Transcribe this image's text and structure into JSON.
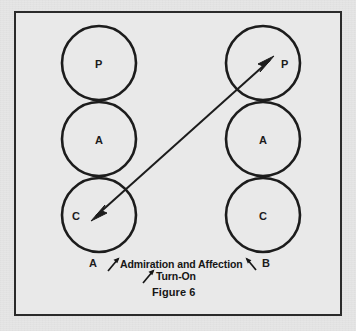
{
  "figure": {
    "number_label": "Figure 6",
    "frame": {
      "border_color": "#2b2b2b",
      "background": "#e9e9e9"
    },
    "page_background": "#e6e6e6",
    "ink_color": "#1c1c1c"
  },
  "diagram": {
    "type": "transactional-analysis-ego-state",
    "persons": [
      {
        "id": "left",
        "person_label": "A",
        "ego_states": [
          {
            "code": "P",
            "name": "Parent"
          },
          {
            "code": "A",
            "name": "Adult"
          },
          {
            "code": "C",
            "name": "Child"
          }
        ]
      },
      {
        "id": "right",
        "person_label": "B",
        "ego_states": [
          {
            "code": "P",
            "name": "Parent"
          },
          {
            "code": "A",
            "name": "Adult"
          },
          {
            "code": "C",
            "name": "Child"
          }
        ]
      }
    ],
    "transaction": {
      "from": "left-child",
      "to": "right-parent",
      "double_headed": true,
      "labels": [
        {
          "text": "Admiration and Affection",
          "pointer": "both"
        },
        {
          "text": "Turn-On",
          "pointer": "up-right"
        }
      ]
    }
  },
  "labels": {
    "left_parent": "P",
    "left_adult": "A",
    "left_child": "C",
    "right_parent": "P",
    "right_adult": "A",
    "right_child": "C",
    "person_a": "A",
    "person_b": "B",
    "transaction_primary": "Admiration and Affection",
    "transaction_secondary": "Turn-On"
  }
}
